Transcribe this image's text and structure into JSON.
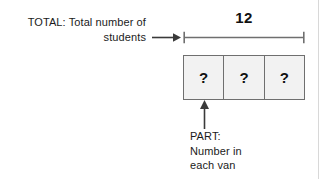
{
  "diagram": {
    "total": {
      "label_lines": [
        "TOTAL: Total number of",
        "students"
      ],
      "value": "12"
    },
    "part": {
      "label_lines": [
        "PART:",
        "Number in",
        "each van"
      ]
    },
    "boxes": [
      {
        "value": "?"
      },
      {
        "value": "?"
      },
      {
        "value": "?"
      }
    ],
    "icons": {
      "right_arrow": "arrow-right-icon",
      "up_arrow": "arrow-up-icon",
      "bracket": "measure-bracket-icon"
    },
    "colors": {
      "stroke": "#6f6f6f",
      "box_fill": "#f2f2f2",
      "text": "#1b1b1b",
      "page_rule": "#d8d8d8"
    }
  }
}
